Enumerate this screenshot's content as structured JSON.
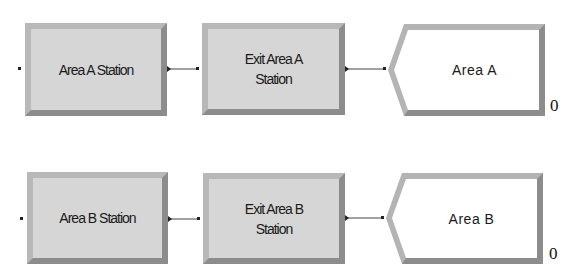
{
  "colors": {
    "station_fill": "#d6d6d6",
    "bevel_light": "#b8b8b8",
    "bevel_dark": "#8c8c8c",
    "leave_fill": "#ffffff",
    "connector": "#222222"
  },
  "rows": [
    {
      "station": {
        "label": "Area A Station"
      },
      "route": {
        "label": "Exit Area A Station"
      },
      "leave": {
        "label": "Area A",
        "count": "0"
      }
    },
    {
      "station": {
        "label": "Area B Station"
      },
      "route": {
        "label": "Exit Area B Station"
      },
      "leave": {
        "label": "Area B",
        "count": "0"
      }
    }
  ]
}
